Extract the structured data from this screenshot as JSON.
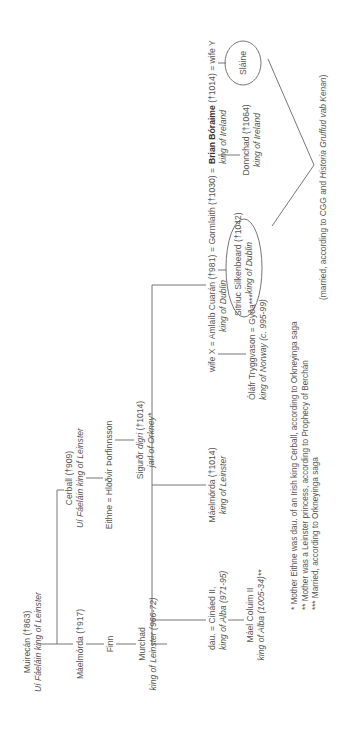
{
  "diagram": {
    "type": "genealogy",
    "orientation": "rotated 90 degrees counter-clockwise",
    "line_color": "#666666",
    "text_color": "#555555",
    "people": {
      "muirecan": {
        "name": "Muirecán (†863)",
        "title": "Uí Fáeláin king of Leinster"
      },
      "maelmorda917": {
        "name": "Máelmórda (†917)"
      },
      "finn": {
        "name": "Finn"
      },
      "murchad": {
        "name": "Murchad",
        "title": "king of Leinster (966-72)"
      },
      "cerball": {
        "name": "Cerball (†909)",
        "title": "Uí Fáeláin king of Leinster"
      },
      "eithne_hlodvir": {
        "name": "Eithne  =  Hlöðvir Þorfinnsson"
      },
      "sigurdr": {
        "name": "Sigurðr ",
        "epithet": "digri",
        "death": " (†1014)",
        "title": "jarl of Orkney*"
      },
      "dau_cinaed": {
        "name": "dau.  =  Cináed II,",
        "title": "king of Alba (971-95)"
      },
      "mael_coluim": {
        "name": "Máel Coluim II",
        "title": "king of Alba (1005-34)**"
      },
      "maelmorda1014": {
        "name": "Máelmórda (†1014)",
        "title": "king of Leinster"
      },
      "wifex_amlaib": {
        "name": "wife X  =  Amlaíb Cuarán (†981)",
        "title": "king of Dublin"
      },
      "olafr_gyda": {
        "name": "Óláfr Tryggvason  =  Gyða***",
        "title": "king of Norway (c. 995-99)"
      },
      "gormlaith": {
        "name": "=  Gormlaith (†1030)  ="
      },
      "brian": {
        "name": "Brian Bóraime",
        "death": " (†1014)  =  wife Y",
        "title": "king of Ireland"
      },
      "sitriuc": {
        "name": "Sitriuc Silkenbeard (†1042)",
        "title": "king of Dublin"
      },
      "donnchad": {
        "name": "Donnchad (†1064)",
        "title": "king of Ireland"
      },
      "slaine": {
        "name": "Sláine"
      }
    },
    "marriage_note": {
      "pre": "(married, according to CGG and ",
      "italic": "Historia Gruffud vab Kenan",
      "post": ")"
    },
    "footnotes": [
      "* Mother Eithne was dau. of an Irish king Cerball, according to Orkneyinga saga",
      "** Mother was a Leinster princess, according to Prophecy of Berchán",
      "*** Married, according to Orkneyinga saga"
    ]
  }
}
